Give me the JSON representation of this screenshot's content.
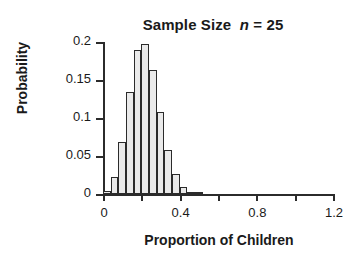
{
  "chart_data": {
    "type": "bar",
    "title": "Sample Size  n = 25",
    "title_plain": "Sample Size",
    "title_italic_var": "n",
    "title_value": "= 25",
    "xlabel": "Proportion of Children",
    "ylabel": "Probability",
    "xlim": [
      0,
      1.2
    ],
    "ylim": [
      0,
      0.2
    ],
    "grid": false,
    "legend": null,
    "bin_width": 0.04,
    "x_ticks": [
      {
        "value": 0,
        "label": "0",
        "major": true
      },
      {
        "value": 0.2,
        "label": "",
        "major": false
      },
      {
        "value": 0.4,
        "label": "0.4",
        "major": true
      },
      {
        "value": 0.6,
        "label": "",
        "major": false
      },
      {
        "value": 0.8,
        "label": "0.8",
        "major": true
      },
      {
        "value": 1.0,
        "label": "",
        "major": false
      },
      {
        "value": 1.2,
        "label": "1.2",
        "major": true
      }
    ],
    "y_ticks": [
      {
        "value": 0,
        "label": "0"
      },
      {
        "value": 0.05,
        "label": "0.05"
      },
      {
        "value": 0.1,
        "label": "0.1"
      },
      {
        "value": 0.15,
        "label": "0.15"
      },
      {
        "value": 0.2,
        "label": "0.2"
      }
    ],
    "bars": [
      {
        "x": 0.0,
        "value": 0.004
      },
      {
        "x": 0.04,
        "value": 0.022
      },
      {
        "x": 0.08,
        "value": 0.068
      },
      {
        "x": 0.12,
        "value": 0.134
      },
      {
        "x": 0.16,
        "value": 0.19
      },
      {
        "x": 0.2,
        "value": 0.197
      },
      {
        "x": 0.24,
        "value": 0.163
      },
      {
        "x": 0.28,
        "value": 0.108
      },
      {
        "x": 0.32,
        "value": 0.058
      },
      {
        "x": 0.36,
        "value": 0.026
      },
      {
        "x": 0.4,
        "value": 0.009
      },
      {
        "x": 0.44,
        "value": 0.003
      },
      {
        "x": 0.48,
        "value": 0.001
      }
    ],
    "categories": [
      0.0,
      0.04,
      0.08,
      0.12,
      0.16,
      0.2,
      0.24,
      0.28,
      0.32,
      0.36,
      0.4,
      0.44,
      0.48
    ],
    "values": [
      0.004,
      0.022,
      0.068,
      0.134,
      0.19,
      0.197,
      0.163,
      0.108,
      0.058,
      0.026,
      0.009,
      0.003,
      0.001
    ],
    "colors": {
      "bar_fill": "#eaeaea",
      "bar_edge": "#2b2b2b",
      "axis": "#2b2b2b",
      "text": "#1a1a1a",
      "background": "#ffffff"
    }
  }
}
